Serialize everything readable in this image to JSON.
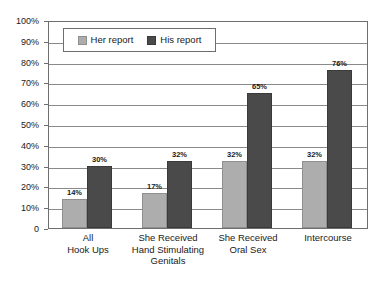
{
  "chart_data": {
    "type": "bar",
    "title": "",
    "subtitle": "",
    "xlabel": "",
    "ylabel": "",
    "ylim": [
      0,
      100
    ],
    "grid": true,
    "legend_position": "top-left-inside",
    "categories": [
      "All\nHook Ups",
      "She Received\nHand Stimulating\nGenitals",
      "She Received\nOral Sex",
      "Intercourse"
    ],
    "series": [
      {
        "name": "Her report",
        "color": "#adadad",
        "values": [
          14,
          17,
          32,
          32
        ],
        "labels": [
          "14%",
          "17%",
          "32%",
          "32%"
        ]
      },
      {
        "name": "His report",
        "color": "#4a4a4a",
        "values": [
          30,
          32,
          65,
          76
        ],
        "labels": [
          "30%",
          "32%",
          "65%",
          "76%"
        ]
      }
    ],
    "y_ticks": [
      {
        "value": 100,
        "label": "100%"
      },
      {
        "value": 90,
        "label": "90%"
      },
      {
        "value": 80,
        "label": "80%"
      },
      {
        "value": 70,
        "label": "70%"
      },
      {
        "value": 60,
        "label": "60%"
      },
      {
        "value": 50,
        "label": "50%"
      },
      {
        "value": 40,
        "label": "40%"
      },
      {
        "value": 30,
        "label": "30%"
      },
      {
        "value": 20,
        "label": "20%"
      },
      {
        "value": 10,
        "label": "10%"
      },
      {
        "value": 0,
        "label": "0"
      }
    ],
    "colors": {
      "her_report": "#adadad",
      "his_report": "#4a4a4a",
      "axis": "#6e6e6e",
      "gridline": "#8a8a8a",
      "background": "#ffffff",
      "text": "#1a1a1a"
    }
  }
}
